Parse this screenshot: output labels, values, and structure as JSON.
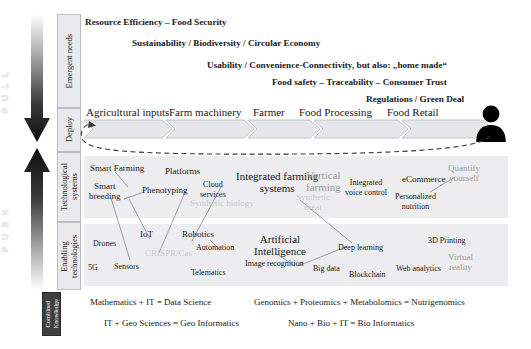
{
  "arrows": {
    "pull": "P U L L",
    "push": "P U S H"
  },
  "stages": [
    {
      "id": "emergent-needs",
      "label": "Emergent needs"
    },
    {
      "id": "deploy",
      "label": "Deploy"
    },
    {
      "id": "technological-systems",
      "label": "Technological\nsystems"
    },
    {
      "id": "enabling-technologies",
      "label": "Enabling\ntechnologies"
    }
  ],
  "emergent_needs": [
    "Resource Efficiency – Food Security",
    "Sustainability / Biodiversity / Circular Economy",
    "Usability / Convenience-Connectivity, but also: „home made“",
    "Food safety – Traceability – Consumer Trust",
    "Regulations / Green Deal"
  ],
  "value_chain": [
    "Agricultural inputs",
    "Farm machinery",
    "Farmer",
    "Food Processing",
    "Food Retail"
  ],
  "consumer_icon": "person-icon",
  "technological_systems": [
    {
      "label": "Smart Farming",
      "tone": "dark"
    },
    {
      "label": "Platforms",
      "tone": "dark"
    },
    {
      "label": "Smart\nbreeding",
      "tone": "dark"
    },
    {
      "label": "Phenotyping",
      "tone": "dark"
    },
    {
      "label": "Cloud\nservices",
      "tone": "dark"
    },
    {
      "label": "Integrated farming\nsystems",
      "tone": "dark"
    },
    {
      "label": "Synthetic biology",
      "tone": "faint"
    },
    {
      "label": "Vertical\nfarming",
      "tone": "grey"
    },
    {
      "label": "Synthetic\nmeat",
      "tone": "faint"
    },
    {
      "label": "Integrated\nvoice control",
      "tone": "dark"
    },
    {
      "label": "eCommerce",
      "tone": "dark"
    },
    {
      "label": "Quantify\nyourself",
      "tone": "grey"
    },
    {
      "label": "Personalized\nnutrition",
      "tone": "dark"
    }
  ],
  "enabling_technologies": [
    {
      "label": "IoT",
      "tone": "dark"
    },
    {
      "label": "Robotics",
      "tone": "dark"
    },
    {
      "label": "Drones",
      "tone": "dark"
    },
    {
      "label": "Automation",
      "tone": "dark"
    },
    {
      "label": "Artificial\nIntelligence",
      "tone": "dark"
    },
    {
      "label": "3D Printing",
      "tone": "dark"
    },
    {
      "label": "CRISPR/Cas",
      "tone": "faint"
    },
    {
      "label": "Deep learning",
      "tone": "dark"
    },
    {
      "label": "5G",
      "tone": "dark"
    },
    {
      "label": "Sensors",
      "tone": "dark"
    },
    {
      "label": "Image recognition",
      "tone": "dark"
    },
    {
      "label": "Big data",
      "tone": "dark"
    },
    {
      "label": "Telematics",
      "tone": "dark"
    },
    {
      "label": "Blockchain",
      "tone": "dark"
    },
    {
      "label": "Web analytics",
      "tone": "dark"
    },
    {
      "label": "Virtual\nreality",
      "tone": "grey"
    }
  ],
  "combined_knowledge": {
    "label": "Combined\nKnowledge",
    "equations": [
      "Mathematics + IT = Data Science",
      "Genomics + Proteomics + Metabolomics = Nutrigenomics",
      "IT + Geo Sciences = Geo Informatics",
      "Nano + Bio + IT = Bio Informatics"
    ]
  },
  "colors": {
    "panel_grey": "#ededef",
    "stage_box": "#e9eaec",
    "knowledge_box": "#3f3f3f",
    "faint_text": "#c9c9c9",
    "grey_text": "#9a9a9a"
  }
}
